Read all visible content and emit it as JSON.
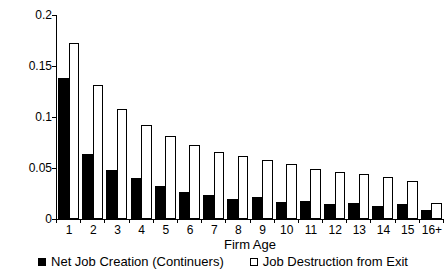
{
  "chart_data": {
    "type": "bar",
    "title": "",
    "xlabel": "Firm Age",
    "ylabel": "",
    "ylim": [
      0,
      0.2
    ],
    "grid": false,
    "legend_position": "bottom",
    "background_color": "#ffffff",
    "axis_color": "#000000",
    "yticks": [
      {
        "value": 0,
        "label": "0"
      },
      {
        "value": 0.05,
        "label": "0.05"
      },
      {
        "value": 0.1,
        "label": "0.1"
      },
      {
        "value": 0.15,
        "label": "0.15"
      },
      {
        "value": 0.2,
        "label": "0.2"
      }
    ],
    "categories": [
      "1",
      "2",
      "3",
      "4",
      "5",
      "6",
      "7",
      "8",
      "9",
      "10",
      "11",
      "12",
      "13",
      "14",
      "15",
      "16+"
    ],
    "series": [
      {
        "name": "Net Job Creation (Continuers)",
        "fill": "#000000",
        "stroke": "#000000",
        "values": [
          0.138,
          0.064,
          0.048,
          0.04,
          0.032,
          0.026,
          0.024,
          0.02,
          0.022,
          0.017,
          0.018,
          0.015,
          0.016,
          0.013,
          0.015,
          0.009
        ]
      },
      {
        "name": "Job Destruction from Exit",
        "fill": "#ffffff",
        "stroke": "#000000",
        "values": [
          0.173,
          0.131,
          0.108,
          0.092,
          0.081,
          0.073,
          0.066,
          0.062,
          0.058,
          0.054,
          0.049,
          0.046,
          0.044,
          0.041,
          0.037,
          0.016
        ]
      }
    ]
  }
}
